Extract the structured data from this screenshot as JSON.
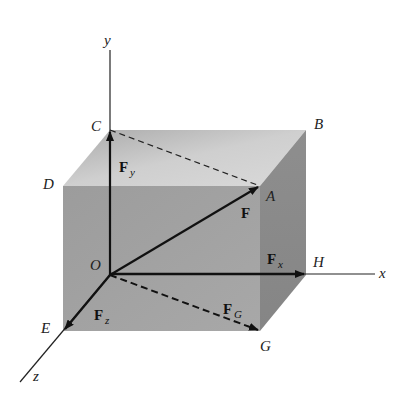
{
  "diagram": {
    "axes": [
      {
        "name": "y",
        "label": "y"
      },
      {
        "name": "x",
        "label": "x"
      },
      {
        "name": "z",
        "label": "z"
      }
    ],
    "points": {
      "O": "O",
      "A": "A",
      "B": "B",
      "C": "C",
      "D": "D",
      "E": "E",
      "G": "G",
      "H": "H"
    },
    "vectors": {
      "F": {
        "main": "F",
        "sub": ""
      },
      "Fx": {
        "main": "F",
        "sub": "x"
      },
      "Fy": {
        "main": "F",
        "sub": "y"
      },
      "Fz": {
        "main": "F",
        "sub": "z"
      },
      "FG": {
        "main": "F",
        "sub": "G"
      }
    },
    "colors": {
      "top_face": "#c4c4c4",
      "front_face": "#9a9a9a",
      "side_face": "#8a8a8a",
      "line": "#111111"
    }
  }
}
